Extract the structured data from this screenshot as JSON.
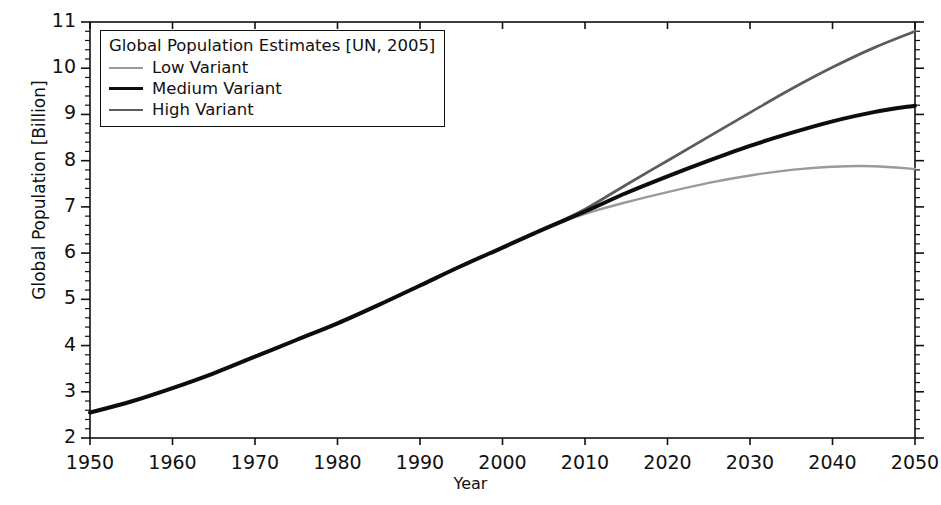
{
  "chart_data": {
    "type": "line",
    "title": "",
    "xlabel": "Year",
    "ylabel": "Global Population [Billion]",
    "xlim": [
      1950,
      2050
    ],
    "ylim": [
      2,
      11
    ],
    "xticks": [
      1950,
      1960,
      1970,
      1980,
      1990,
      2000,
      2010,
      2020,
      2030,
      2040,
      2050
    ],
    "yticks": [
      2,
      3,
      4,
      5,
      6,
      7,
      8,
      9,
      10,
      11
    ],
    "minor_tick_step_y": 0.2,
    "grid": false,
    "legend_position": "upper-left",
    "legend_title": "Global Population Estimates [UN, 2005]",
    "x": [
      1950,
      1955,
      1960,
      1965,
      1970,
      1975,
      1980,
      1985,
      1990,
      1995,
      2000,
      2005,
      2010,
      2015,
      2020,
      2025,
      2030,
      2035,
      2040,
      2045,
      2050
    ],
    "series": [
      {
        "name": "Low Variant",
        "color": "#9a9a9a",
        "width": 2.4,
        "values": [
          2.55,
          2.79,
          3.08,
          3.4,
          3.76,
          4.12,
          4.48,
          4.88,
          5.3,
          5.72,
          6.12,
          6.52,
          6.85,
          7.1,
          7.32,
          7.52,
          7.68,
          7.8,
          7.87,
          7.88,
          7.82
        ]
      },
      {
        "name": "Medium Variant",
        "color": "#0d0d0d",
        "width": 4.0,
        "values": [
          2.55,
          2.79,
          3.08,
          3.4,
          3.76,
          4.12,
          4.48,
          4.88,
          5.3,
          5.72,
          6.12,
          6.52,
          6.9,
          7.3,
          7.66,
          8.0,
          8.32,
          8.6,
          8.85,
          9.05,
          9.19
        ]
      },
      {
        "name": "High Variant",
        "color": "#5c5c5c",
        "width": 2.8,
        "values": [
          2.55,
          2.79,
          3.08,
          3.4,
          3.76,
          4.12,
          4.48,
          4.88,
          5.3,
          5.72,
          6.12,
          6.52,
          6.95,
          7.48,
          8.0,
          8.52,
          9.04,
          9.55,
          10.02,
          10.44,
          10.8
        ]
      }
    ],
    "notes": {
      "divergence_year": 2006,
      "low_peak_year": 2044,
      "low_peak_value": 7.88
    }
  },
  "axes": {
    "frame_color": "#111111",
    "background": "#ffffff"
  }
}
